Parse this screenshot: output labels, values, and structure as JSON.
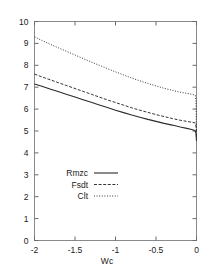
{
  "chart_data": {
    "type": "line",
    "title": "",
    "xlabel": "Wc",
    "ylabel": "",
    "xlim": [
      -2,
      0
    ],
    "ylim": [
      0,
      10
    ],
    "grid": false,
    "legend_position": "lower-left-inside",
    "xticks": [
      -2,
      -1.5,
      -1,
      -0.5,
      0
    ],
    "xtick_labels": [
      "-2",
      "-1.5",
      "-1",
      "-0.5",
      "0"
    ],
    "yticks": [
      0,
      1,
      2,
      3,
      4,
      5,
      6,
      7,
      8,
      9,
      10
    ],
    "ytick_labels": [
      "0",
      "1",
      "2",
      "3",
      "4",
      "5",
      "6",
      "7",
      "8",
      "9",
      "10"
    ],
    "series": [
      {
        "name": "Rmzc",
        "style": "solid",
        "x": [
          -2.0,
          -1.9,
          -1.8,
          -1.7,
          -1.6,
          -1.5,
          -1.4,
          -1.3,
          -1.2,
          -1.1,
          -1.0,
          -0.9,
          -0.8,
          -0.7,
          -0.6,
          -0.5,
          -0.4,
          -0.3,
          -0.2,
          -0.12,
          -0.06,
          -0.03,
          -0.015,
          -0.006,
          0.0
        ],
        "values": [
          7.15,
          7.03,
          6.91,
          6.79,
          6.67,
          6.55,
          6.43,
          6.31,
          6.19,
          6.07,
          5.95,
          5.84,
          5.73,
          5.63,
          5.53,
          5.44,
          5.35,
          5.27,
          5.18,
          5.12,
          5.07,
          5.03,
          5.0,
          4.88,
          4.55
        ]
      },
      {
        "name": "Fsdt",
        "style": "dashed",
        "x": [
          -2.0,
          -1.9,
          -1.8,
          -1.7,
          -1.6,
          -1.5,
          -1.4,
          -1.3,
          -1.2,
          -1.1,
          -1.0,
          -0.9,
          -0.8,
          -0.7,
          -0.6,
          -0.5,
          -0.4,
          -0.3,
          -0.2,
          -0.12,
          -0.06,
          -0.03,
          -0.015,
          -0.006,
          0.0
        ],
        "values": [
          7.6,
          7.46,
          7.33,
          7.2,
          7.07,
          6.94,
          6.81,
          6.68,
          6.55,
          6.42,
          6.3,
          6.18,
          6.06,
          5.95,
          5.85,
          5.75,
          5.66,
          5.57,
          5.49,
          5.44,
          5.4,
          5.38,
          5.37,
          5.2,
          4.72
        ]
      },
      {
        "name": "Clt",
        "style": "dotted",
        "x": [
          -2.0,
          -1.9,
          -1.8,
          -1.7,
          -1.6,
          -1.5,
          -1.4,
          -1.3,
          -1.2,
          -1.1,
          -1.0,
          -0.9,
          -0.8,
          -0.7,
          -0.6,
          -0.5,
          -0.4,
          -0.3,
          -0.2,
          -0.12,
          -0.06,
          -0.03,
          -0.015,
          -0.006,
          0.0
        ],
        "values": [
          9.3,
          9.12,
          8.95,
          8.79,
          8.63,
          8.47,
          8.31,
          8.15,
          8.0,
          7.85,
          7.7,
          7.56,
          7.42,
          7.29,
          7.17,
          7.06,
          6.95,
          6.86,
          6.77,
          6.72,
          6.68,
          6.65,
          6.63,
          6.35,
          5.05
        ]
      }
    ]
  },
  "legend": {
    "entries": [
      {
        "label": "Rmzc",
        "style": "solid"
      },
      {
        "label": "Fsdt",
        "style": "dashed"
      },
      {
        "label": "Clt",
        "style": "dotted"
      }
    ]
  },
  "axis": {
    "x_title": "Wc"
  }
}
